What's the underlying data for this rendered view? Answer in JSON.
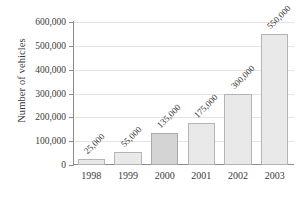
{
  "chart_data": {
    "type": "bar",
    "title": "",
    "xlabel": "",
    "ylabel": "Number of vehicles",
    "categories": [
      "1998",
      "1999",
      "2000",
      "2001",
      "2002",
      "2003"
    ],
    "values": [
      25000,
      55000,
      135000,
      175000,
      300000,
      550000
    ],
    "value_labels": [
      "25,000",
      "55,000",
      "135,000",
      "175,000",
      "300,000",
      "550,000"
    ],
    "ylim": [
      0,
      600000
    ],
    "ytick_values": [
      0,
      100000,
      200000,
      300000,
      400000,
      500000,
      600000
    ],
    "ytick_labels": [
      "0",
      "100,000",
      "200,000",
      "300,000",
      "400,000",
      "500,000",
      "600,000"
    ],
    "grid": true,
    "legend": false,
    "legend_position": "none",
    "series": [
      {
        "name": "Number of vehicles",
        "values": [
          25000,
          55000,
          135000,
          175000,
          300000,
          550000
        ]
      }
    ],
    "bar_colors": [
      "#e9e9e9",
      "#e9e9e9",
      "#d4d4d4",
      "#e9e9e9",
      "#e9e9e9",
      "#e9e9e9"
    ],
    "bar_border_color": "#b4b4b4",
    "gridline_color": "#e4e4e4",
    "axis_color": "#8d8d8d",
    "text_color": "#3a3a3a"
  }
}
